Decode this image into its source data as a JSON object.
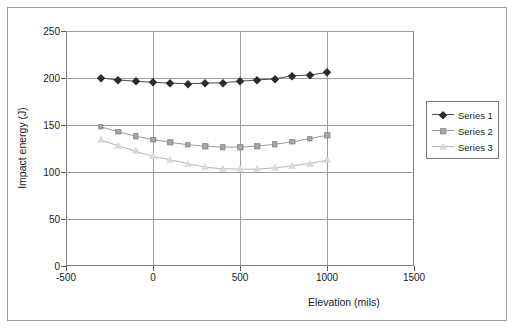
{
  "chart_data": {
    "type": "line",
    "title": "",
    "xlabel": "Elevation (mils)",
    "ylabel": "Impact energy (J)",
    "xlim": [
      -500,
      1500
    ],
    "ylim": [
      0,
      250
    ],
    "xticks": [
      -500,
      0,
      500,
      1000,
      1500
    ],
    "yticks": [
      0,
      50,
      100,
      150,
      200,
      250
    ],
    "grid": true,
    "legend_position": "right",
    "x": [
      -300,
      -200,
      -100,
      0,
      100,
      200,
      300,
      400,
      500,
      600,
      700,
      800,
      900,
      1000
    ],
    "series": [
      {
        "name": "Series 1",
        "marker": "diamond",
        "color": "#2b2b2b",
        "values": [
          200,
          198,
          196.5,
          195.5,
          194.5,
          194,
          194.5,
          195,
          196.5,
          198,
          199,
          202.5,
          203,
          206
        ]
      },
      {
        "name": "Series 2",
        "marker": "square",
        "color": "#a8a8a8",
        "values": [
          148,
          143,
          138,
          134.5,
          131.5,
          129,
          127.5,
          126.5,
          126.5,
          127.5,
          129.5,
          132,
          135.5,
          139
        ]
      },
      {
        "name": "Series 3",
        "marker": "triangle",
        "color": "#d9d9d9",
        "values": [
          134,
          128,
          122,
          116.5,
          113,
          109,
          105,
          103.5,
          103,
          103,
          104.5,
          106.5,
          109,
          112.5
        ]
      }
    ]
  },
  "legend": {
    "entries": [
      {
        "label": "Series 1"
      },
      {
        "label": "Series 2"
      },
      {
        "label": "Series 3"
      }
    ]
  },
  "axes": {
    "y_tick_labels": [
      "250",
      "200",
      "150",
      "100",
      "50",
      "0"
    ],
    "x_tick_labels": [
      "-500",
      "0",
      "500",
      "1000",
      "1500"
    ]
  }
}
